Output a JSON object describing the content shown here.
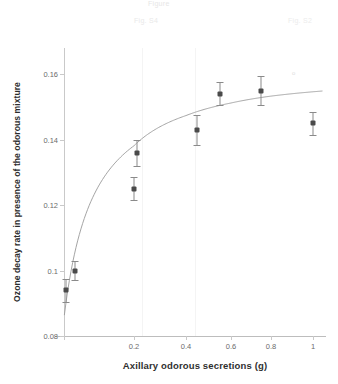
{
  "figure": {
    "background_color": "#ffffff",
    "ghost_header_top": "Figure",
    "ghost_header_left": "Fig. S4",
    "ghost_header_right": "Fig. S2",
    "curve_smudge_mark": "o"
  },
  "axes": {
    "x": {
      "label": "Axillary odorous secretions (g)",
      "tick_labels": [
        "0",
        "0.2",
        "0.4",
        "0.6",
        "0.8",
        "1"
      ],
      "tick_values": [
        0,
        0.2,
        0.4,
        0.6,
        0.8,
        1.0
      ],
      "tick_positions_px": [
        0,
        70,
        122,
        167,
        207,
        249
      ],
      "range": [
        0,
        1.05
      ]
    },
    "y": {
      "label": "Ozone decay rate in presence of the odorous mixture",
      "tick_labels": [
        "0.08",
        "0.1",
        "0.12",
        "0.14",
        "0.16"
      ],
      "tick_values": [
        0.08,
        0.1,
        0.12,
        0.14,
        0.16
      ],
      "range": [
        0.08,
        0.168
      ]
    }
  },
  "chart_data": {
    "type": "scatter",
    "title": "",
    "xlabel": "Axillary odorous secretions (g)",
    "ylabel": "Ozone decay rate in presence of the odorous mixture",
    "xlim": [
      0,
      1.05
    ],
    "ylim": [
      0.08,
      0.168
    ],
    "grid": false,
    "legend": "none",
    "error_bars": "symmetric-vertical",
    "series": [
      {
        "name": "Ozone decay rate measurements",
        "marker": "filled-square",
        "marker_color": "#4a4a4a",
        "x": [
          0.005,
          0.03,
          0.2,
          0.21,
          0.45,
          0.55,
          0.75,
          1.0
        ],
        "y": [
          0.094,
          0.1,
          0.125,
          0.136,
          0.143,
          0.154,
          0.155,
          0.145
        ],
        "yerr": [
          0.0035,
          0.003,
          0.0035,
          0.004,
          0.0045,
          0.0035,
          0.0045,
          0.0035
        ]
      },
      {
        "name": "Fitted saturation curve",
        "type": "line",
        "line_color": "#9a9a9a",
        "line_style": "solid",
        "description": "Monotonic saturating (Michaelis-Menten / Langmuir type) fit rising steeply from ~0.090 at x=0 toward an asymptote near 0.157"
      }
    ]
  },
  "points": [
    {
      "x": 0.005,
      "y": 0.094,
      "yerr": 0.0035
    },
    {
      "x": 0.03,
      "y": 0.1,
      "yerr": 0.003
    },
    {
      "x": 0.2,
      "y": 0.125,
      "yerr": 0.0035
    },
    {
      "x": 0.21,
      "y": 0.136,
      "yerr": 0.004
    },
    {
      "x": 0.45,
      "y": 0.143,
      "yerr": 0.0045
    },
    {
      "x": 0.55,
      "y": 0.154,
      "yerr": 0.0035
    },
    {
      "x": 0.75,
      "y": 0.155,
      "yerr": 0.0045
    },
    {
      "x": 1.0,
      "y": 0.145,
      "yerr": 0.0035
    }
  ],
  "scan_bands_px": [
    78,
    131
  ]
}
